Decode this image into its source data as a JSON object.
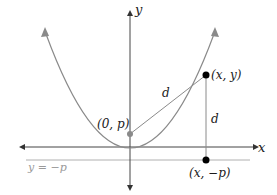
{
  "diagram": {
    "axes": {
      "x_label": "x",
      "y_label": "y"
    },
    "directrix": {
      "label": "y = −p"
    },
    "focus": {
      "label": "(0, p)"
    },
    "point_on_curve": {
      "label": "(x, y)"
    },
    "point_on_directrix": {
      "label": "(x, −p)"
    },
    "distance_labels": {
      "focus_to_point": "d",
      "point_to_directrix": "d"
    },
    "colors": {
      "axis": "#555555",
      "curve": "#8a8a8a",
      "directrix": "#aaaaaa",
      "point": "#000000",
      "focus": "#8a8a8a"
    }
  }
}
